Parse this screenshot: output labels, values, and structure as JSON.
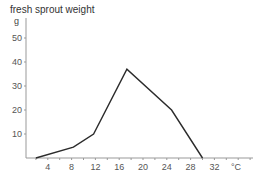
{
  "chart_data": {
    "type": "line",
    "title": "fresh sprout weight",
    "xlabel": "°C",
    "ylabel": "g",
    "xlim": [
      0.3,
      38.5
    ],
    "ylim": [
      0,
      58
    ],
    "x_ticks": [
      4,
      8,
      12,
      16,
      20,
      24,
      28,
      32
    ],
    "x_tick_labels": [
      "4",
      "8",
      "12",
      "16",
      "20",
      "24",
      "28",
      "32"
    ],
    "y_ticks": [
      10,
      20,
      30,
      40,
      50
    ],
    "y_tick_labels": [
      "10",
      "20",
      "30",
      "40",
      "50"
    ],
    "grid": false,
    "legend": null,
    "series": [
      {
        "name": "fresh sprout weight",
        "x": [
          2,
          8.3,
          11.7,
          17.3,
          24.8,
          30
        ],
        "y": [
          0,
          4.5,
          10,
          37,
          20,
          0
        ]
      }
    ]
  },
  "colors": {
    "line": "#2b2b2b",
    "axis": "#999999",
    "text": "#555555"
  }
}
